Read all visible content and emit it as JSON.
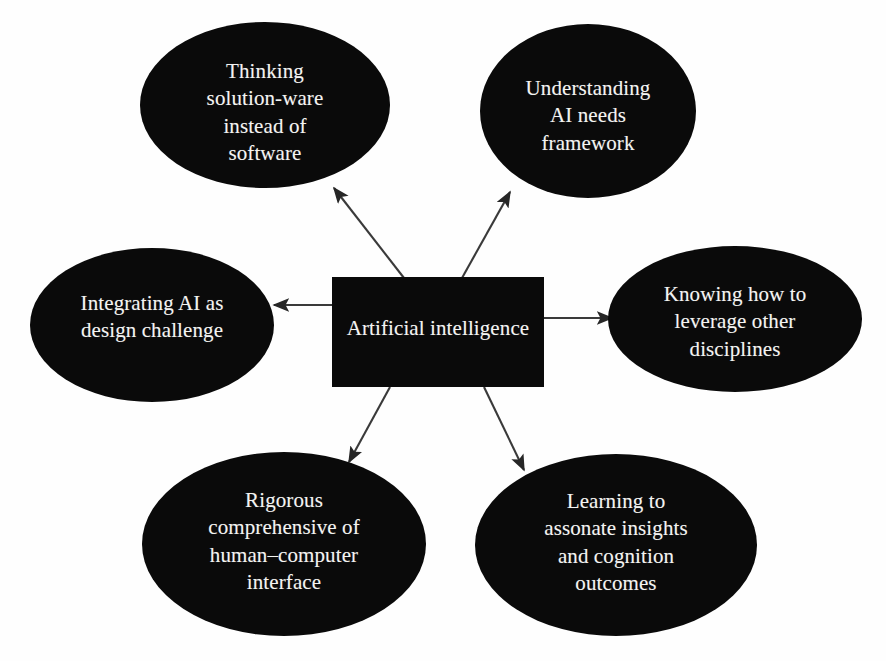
{
  "diagram": {
    "type": "hub-and-spoke concept map",
    "background_color": "#fefefe",
    "node_fill_color": "#0a0a0a",
    "node_text_color": "#f4f4f2",
    "connector_color": "#3a3a3a",
    "center": {
      "shape": "rectangle",
      "label": "Artificial intelligence"
    },
    "nodes": [
      {
        "id": "thinking-solution-ware",
        "shape": "ellipse",
        "position": "top-left",
        "label": "Thinking\nsolution-ware\ninstead of\nsoftware"
      },
      {
        "id": "understanding-ai-needs",
        "shape": "ellipse",
        "position": "top-right",
        "label": "Understanding\nAI needs\nframework"
      },
      {
        "id": "integrating-ai",
        "shape": "ellipse",
        "position": "left",
        "label": "Integrating AI as\ndesign challenge"
      },
      {
        "id": "knowing-leverage",
        "shape": "ellipse",
        "position": "right",
        "label": "Knowing how to\nleverage other\ndisciplines"
      },
      {
        "id": "rigorous-comprehensive",
        "shape": "ellipse",
        "position": "bottom-left",
        "label": "Rigorous\ncomprehensive of\nhuman–computer\ninterface"
      },
      {
        "id": "learning-assonate",
        "shape": "ellipse",
        "position": "bottom-right",
        "label": "Learning to\nassonate insights\nand cognition\noutcomes"
      }
    ],
    "connectors": [
      {
        "from": "center",
        "to": "thinking-solution-ware",
        "arrow": "single"
      },
      {
        "from": "center",
        "to": "understanding-ai-needs",
        "arrow": "single"
      },
      {
        "from": "center",
        "to": "integrating-ai",
        "arrow": "single"
      },
      {
        "from": "center",
        "to": "knowing-leverage",
        "arrow": "single"
      },
      {
        "from": "center",
        "to": "rigorous-comprehensive",
        "arrow": "single"
      },
      {
        "from": "center",
        "to": "learning-assonate",
        "arrow": "single"
      }
    ]
  }
}
